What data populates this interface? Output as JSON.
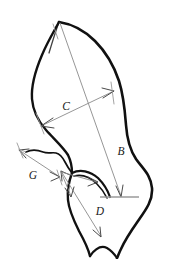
{
  "figure": {
    "kind": "leaf-morphology-measurement-diagram",
    "background_color": "#ffffff",
    "outline_color": "#111111",
    "dimension_line_color": "#8a8a8a",
    "arrow_head_color": "#4a4a4a",
    "label_color": "#1a1a1a",
    "width_px": 177,
    "height_px": 259
  },
  "labels": {
    "b": "B",
    "c": "C",
    "d": "D",
    "g": "G"
  },
  "measurements": [
    {
      "id": "b",
      "label": "B",
      "description": "long axis from leaf apex to base line",
      "label_x": 121,
      "label_y": 152,
      "from_x": 59,
      "from_y": 22,
      "to_x": 121,
      "to_y": 197,
      "double_headed": false
    },
    {
      "id": "c",
      "label": "C",
      "description": "maximum width of upper blade, measured obliquely",
      "label_x": 66,
      "label_y": 107,
      "from_x": 41,
      "from_y": 126,
      "to_x": 114,
      "to_y": 91,
      "double_headed": true
    },
    {
      "id": "d",
      "label": "D",
      "description": "length of lower lobe from sinus to lobe tip",
      "label_x": 100,
      "label_y": 212,
      "from_x": 61,
      "from_y": 171,
      "to_x": 101,
      "to_y": 236,
      "double_headed": true
    },
    {
      "id": "g",
      "label": "G",
      "description": "width of basal lobe",
      "label_x": 33,
      "label_y": 176,
      "from_x": 19,
      "from_y": 150,
      "to_x": 60,
      "to_y": 177,
      "double_headed": true
    }
  ],
  "base_rule": {
    "description": "horizontal reference line at leaf base",
    "x1": 100,
    "x2": 139,
    "y": 197,
    "color": "#9a9a9a"
  },
  "leaf_outline": {
    "apex": {
      "x": 59,
      "y": 22
    },
    "right_edge_path": "M59,22 C78,27 95,42 108,60 C121,78 129,98 133,118 C138,140 139,158 143,172 C148,187 155,194 153,207 C150,222 136,232 128,243 C122,251 119,255 117,257",
    "left_edge_path": "M59,22 C52,32 45,44 40,58 C34,74 31,92 33,106 C35,120 41,128 48,135 C56,143 65,150 69,158 C72,165 72,172 72,178",
    "lower_left_path": "M72,178 C69,188 69,200 73,212 C76,222 81,231 85,240 C88,246 90,251 91,255",
    "sinus_path": "M61,171 C70,168 82,170 92,178 C100,185 105,192 107,197",
    "inner_vein_path": "M62,172 C71,170 83,173 92,181 C99,187 103,193 105,198",
    "basal_lobe_path": "M27,153 C36,150 45,152 52,157 C57,161 60,166 61,171",
    "bottom_notch_path": "M91,255 C95,248 101,244 107,247 C112,250 115,254 117,257"
  }
}
